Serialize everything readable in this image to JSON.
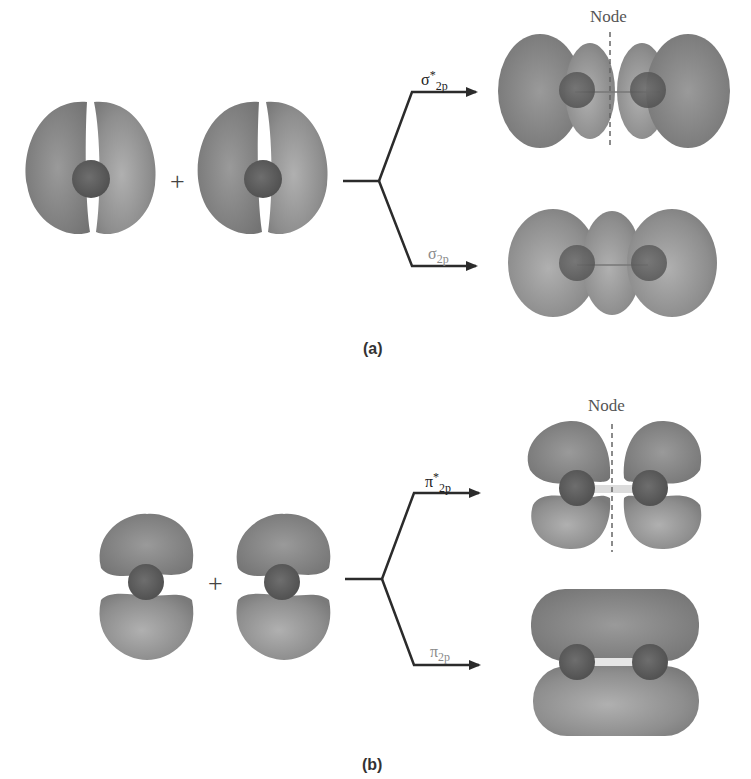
{
  "figure": {
    "panels": [
      {
        "id": "a",
        "label": "(a)",
        "combination": "p + p (end-on, along bond axis)",
        "plus_sign": "+",
        "results": [
          {
            "name": "sigma-star-2p",
            "symbol": "σ",
            "star": "*",
            "subscript": "2p",
            "node_label": "Node",
            "position": "upper"
          },
          {
            "name": "sigma-2p",
            "symbol": "σ",
            "star": "",
            "subscript": "2p",
            "position": "lower"
          }
        ]
      },
      {
        "id": "b",
        "label": "(b)",
        "combination": "p + p (side-on, perpendicular to bond axis)",
        "plus_sign": "+",
        "results": [
          {
            "name": "pi-star-2p",
            "symbol": "π",
            "star": "*",
            "subscript": "2p",
            "node_label": "Node",
            "position": "upper"
          },
          {
            "name": "pi-2p",
            "symbol": "π",
            "star": "",
            "subscript": "2p",
            "position": "lower"
          }
        ]
      }
    ],
    "colors": {
      "lobe": "#8c8c8c",
      "lobe_light": "#a6a6a6",
      "nucleus": "#5e5e5e",
      "line": "#2b2b2b",
      "node_line": "#666666"
    }
  }
}
